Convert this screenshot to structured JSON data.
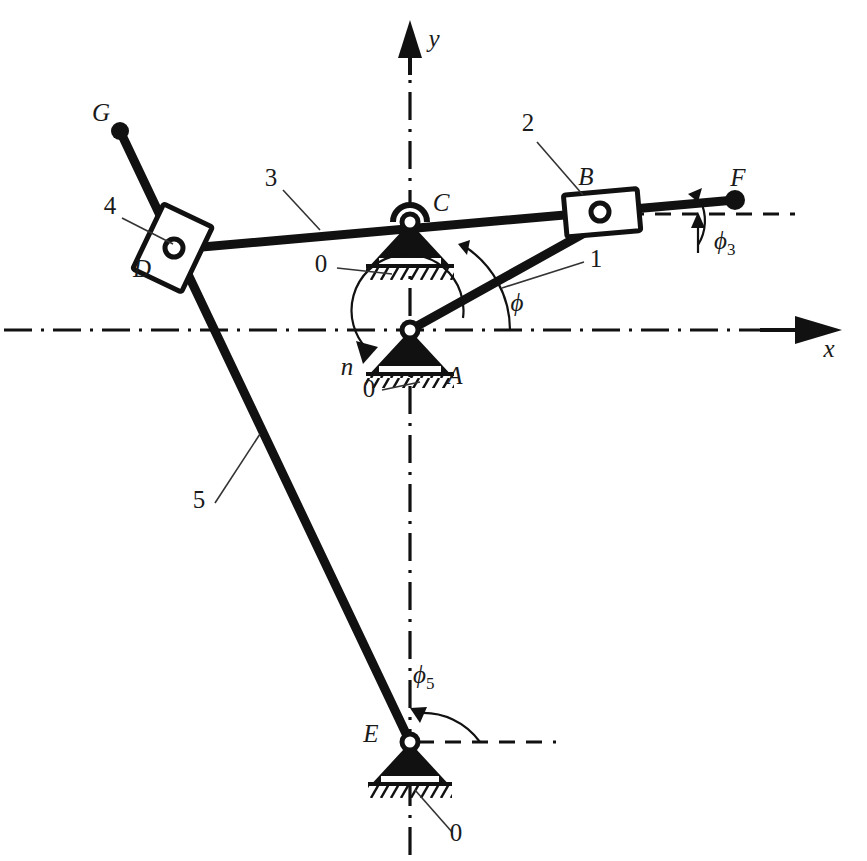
{
  "figure": {
    "background_color": "#ffffff",
    "line_color": "#111111"
  },
  "axes": {
    "x_label": "x",
    "y_label": "y",
    "x_axis_name": "horizontal-axis",
    "y_axis_name": "vertical-axis",
    "style": "dash-dot centerline",
    "origin_point": "A"
  },
  "points": {
    "A": {
      "label": "A",
      "x": 410,
      "y": 330,
      "type": "fixed-pivot"
    },
    "B": {
      "label": "B",
      "x": 600,
      "y": 212,
      "type": "slider-pin"
    },
    "C": {
      "label": "C",
      "x": 410,
      "y": 222,
      "type": "fixed-pivot"
    },
    "D": {
      "label": "D",
      "x": 173,
      "y": 247,
      "type": "slider-pin"
    },
    "E": {
      "label": "E",
      "x": 410,
      "y": 742,
      "type": "fixed-pivot"
    },
    "F": {
      "label": "F",
      "x": 735,
      "y": 200,
      "type": "endpoint"
    },
    "G": {
      "label": "G",
      "x": 120,
      "y": 131,
      "type": "endpoint"
    }
  },
  "links": [
    {
      "number": "1",
      "name": "crank-AB",
      "from": "A",
      "to": "B"
    },
    {
      "number": "2",
      "name": "slider-block-B",
      "at": "B"
    },
    {
      "number": "3",
      "name": "rocker-DCF",
      "from": "D",
      "to": "F"
    },
    {
      "number": "4",
      "name": "slider-block-D",
      "at": "D"
    },
    {
      "number": "5",
      "name": "link-GE",
      "from": "G",
      "to": "E"
    }
  ],
  "link_labels": [
    {
      "text": "1",
      "x": 596,
      "y": 267
    },
    {
      "text": "2",
      "x": 528,
      "y": 131
    },
    {
      "text": "3",
      "x": 271,
      "y": 186
    },
    {
      "text": "4",
      "x": 110,
      "y": 214
    },
    {
      "text": "5",
      "x": 199,
      "y": 508
    }
  ],
  "ground_labels": [
    {
      "text": "0",
      "x": 321,
      "y": 272,
      "name": "ground-label-C"
    },
    {
      "text": "0",
      "x": 369,
      "y": 397,
      "name": "ground-label-A"
    },
    {
      "text": "0",
      "x": 456,
      "y": 841,
      "name": "ground-label-E"
    }
  ],
  "angles": [
    {
      "symbol": "ϕ",
      "subscript": "",
      "name": "phi-crank-angle",
      "label_x": 517,
      "label_y": 311,
      "at": "A"
    },
    {
      "symbol": "ϕ",
      "subscript": "3",
      "name": "phi3-rocker-angle",
      "label_x": 714,
      "label_y": 249,
      "at": "F"
    },
    {
      "symbol": "ϕ",
      "subscript": "5",
      "name": "phi5-link5-angle",
      "label_x": 413,
      "label_y": 683,
      "at": "E"
    }
  ],
  "rotation": {
    "symbol": "n",
    "name": "drive-rotation-speed",
    "label_x": 347,
    "label_y": 375,
    "direction": "counterclockwise-arrow-at-A"
  },
  "point_labels": [
    {
      "text": "G",
      "x": 101,
      "y": 121
    },
    {
      "text": "D",
      "x": 142,
      "y": 277
    },
    {
      "text": "C",
      "x": 441,
      "y": 211
    },
    {
      "text": "B",
      "x": 586,
      "y": 185
    },
    {
      "text": "F",
      "x": 738,
      "y": 186
    },
    {
      "text": "A",
      "x": 455,
      "y": 384
    },
    {
      "text": "E",
      "x": 371,
      "y": 742
    }
  ],
  "axis_labels": [
    {
      "text": "y",
      "x": 434,
      "y": 47
    },
    {
      "text": "x",
      "x": 829,
      "y": 357
    }
  ]
}
